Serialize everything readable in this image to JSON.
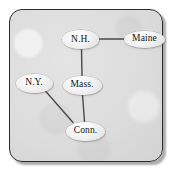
{
  "figure": {
    "type": "undirected-graph-diagram",
    "title": "",
    "frame": {
      "border_color": "#2b2b2b",
      "background_color": "#dcdcdc",
      "corner_radius_px": 13,
      "shadow": true
    },
    "node_style": {
      "shape": "ellipse",
      "fill_color": "#f0f0f0",
      "outline_color": "#9a9a9a",
      "label_color": "#101010"
    },
    "edge_style": {
      "color": "#4a4a4a",
      "width_px": 1.4
    }
  },
  "graph": {
    "nodes": [
      {
        "id": "nh",
        "label": "N.H.",
        "x": 80.5,
        "y": 39.5,
        "rx": 18.5,
        "ry": 9.5
      },
      {
        "id": "maine",
        "label": "Maine",
        "x": 144.5,
        "y": 39.0,
        "rx": 20.5,
        "ry": 8.5
      },
      {
        "id": "mass",
        "label": "Mass.",
        "x": 82.0,
        "y": 85.0,
        "rx": 19.5,
        "ry": 9.5
      },
      {
        "id": "ny",
        "label": "N.Y.",
        "x": 34.0,
        "y": 83.0,
        "rx": 18.5,
        "ry": 9.5
      },
      {
        "id": "conn",
        "label": "Conn.",
        "x": 85.5,
        "y": 131.0,
        "rx": 19.5,
        "ry": 9.5
      }
    ],
    "edges": [
      {
        "id": "nh-maine",
        "from": "nh",
        "to": "maine",
        "x1": 99.5,
        "y1": 39.0,
        "x2": 124.0,
        "y2": 39.0
      },
      {
        "id": "nh-mass",
        "from": "nh",
        "to": "mass",
        "x1": 81.5,
        "y1": 49.0,
        "x2": 82.0,
        "y2": 75.5
      },
      {
        "id": "mass-conn",
        "from": "mass",
        "to": "conn",
        "x1": 82.5,
        "y1": 94.5,
        "x2": 84.5,
        "y2": 121.5
      },
      {
        "id": "ny-conn",
        "from": "ny",
        "to": "conn",
        "x1": 45.0,
        "y1": 90.5,
        "x2": 73.0,
        "y2": 122.5
      }
    ]
  }
}
